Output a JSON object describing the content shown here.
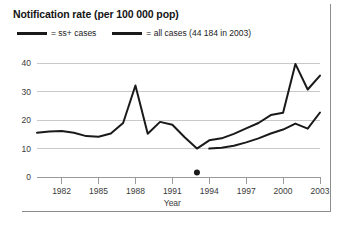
{
  "chart_data": {
    "type": "line",
    "title": "Notification rate (per 100 000 pop)",
    "xlabel": "Year",
    "ylabel": "",
    "xlim": [
      1980,
      2003
    ],
    "ylim": [
      0,
      44
    ],
    "yticks": [
      0,
      10,
      20,
      30,
      40
    ],
    "ytick_labels": [
      "0",
      "10",
      "20",
      "30",
      "40"
    ],
    "xticks": [
      1982,
      1985,
      1988,
      1991,
      1994,
      1997,
      2000,
      2003
    ],
    "xtick_labels": [
      "1982",
      "1985",
      "1988",
      "1991",
      "1994",
      "1997",
      "2000",
      "2003"
    ],
    "grid": "horizontal",
    "legend_position": "top-left",
    "series": [
      {
        "name": "ss+ cases",
        "legend_label": "= ss+ cases",
        "color": "#1a1a1a",
        "x": [
          1994,
          1995,
          1996,
          1997,
          1998,
          1999,
          2000,
          2001,
          2002,
          2003
        ],
        "values": [
          10.0,
          10.3,
          11.0,
          12.2,
          13.6,
          15.3,
          16.7,
          18.8,
          17.0,
          22.7
        ]
      },
      {
        "name": "all cases",
        "legend_label": "= all cases (44 184 in 2003)",
        "color": "#1a1a1a",
        "x": [
          1980,
          1981,
          1982,
          1983,
          1984,
          1985,
          1986,
          1987,
          1988,
          1989,
          1990,
          1991,
          1992,
          1993,
          1994,
          1995,
          1996,
          1997,
          1998,
          1999,
          2000,
          2001,
          2002,
          2003
        ],
        "values": [
          15.6,
          16.0,
          16.2,
          15.6,
          14.4,
          14.2,
          15.3,
          19.0,
          32.2,
          15.2,
          19.4,
          18.4,
          14.0,
          10.0,
          12.9,
          13.6,
          15.2,
          17.1,
          19.0,
          21.8,
          22.6,
          39.8,
          30.8,
          35.7
        ]
      }
    ],
    "annotations": [
      {
        "name": "axis-marker-dot",
        "x": 1993,
        "y": 1.6,
        "shape": "circle",
        "color": "#1a1a1a"
      }
    ]
  },
  "axis_titles": {
    "x": "Year"
  },
  "colors": {
    "line": "#1a1a1a",
    "grid": "#c9c9c9",
    "axis": "#9a9a9a",
    "text": "#3a3a3a",
    "title": "#141414",
    "frame": "#8d8d8d"
  }
}
